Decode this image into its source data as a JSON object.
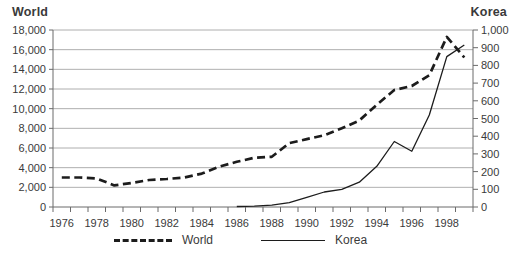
{
  "chart_data": {
    "type": "line",
    "title": "",
    "grid": "horizontal",
    "legend_position": "bottom",
    "categories": [
      1976,
      1977,
      1978,
      1979,
      1980,
      1981,
      1982,
      1983,
      1984,
      1985,
      1986,
      1987,
      1988,
      1989,
      1990,
      1991,
      1992,
      1993,
      1994,
      1995,
      1996,
      1997,
      1998,
      1999
    ],
    "x_tick_labels": [
      "1976",
      "1978",
      "1980",
      "1982",
      "1984",
      "1986",
      "1988",
      "1990",
      "1992",
      "1994",
      "1996",
      "1998"
    ],
    "series": [
      {
        "name": "World",
        "axis": "left",
        "style": "dashed",
        "values": [
          3000,
          3000,
          2900,
          2200,
          2450,
          2750,
          2850,
          3000,
          3400,
          4100,
          4600,
          5000,
          5100,
          6500,
          6900,
          7300,
          8000,
          8800,
          10400,
          11900,
          12300,
          13400,
          17300,
          15200
        ]
      },
      {
        "name": "Korea",
        "axis": "right",
        "style": "solid",
        "values": [
          null,
          null,
          null,
          null,
          null,
          null,
          null,
          null,
          null,
          null,
          3,
          5,
          10,
          25,
          55,
          85,
          100,
          140,
          230,
          370,
          315,
          520,
          850,
          915
        ]
      }
    ],
    "left_axis": {
      "title": "World",
      "min": 0,
      "max": 18000,
      "step": 2000,
      "tick_labels": [
        "0",
        "2,000",
        "4,000",
        "6,000",
        "8,000",
        "10,000",
        "12,000",
        "14,000",
        "16,000",
        "18,000"
      ]
    },
    "right_axis": {
      "title": "Korea",
      "min": 0,
      "max": 1000,
      "step": 100,
      "tick_labels": [
        "0",
        "100",
        "200",
        "300",
        "400",
        "500",
        "600",
        "700",
        "800",
        "900",
        "1,000"
      ]
    },
    "colors": {
      "series_line": "#1c1c1c",
      "gridline": "#9a9a9a",
      "axis_line": "#6b6b6b",
      "tick_text": "#3a3a3a"
    }
  },
  "legend": {
    "items": [
      {
        "label": "World",
        "style": "dashed"
      },
      {
        "label": "Korea",
        "style": "solid"
      }
    ]
  }
}
